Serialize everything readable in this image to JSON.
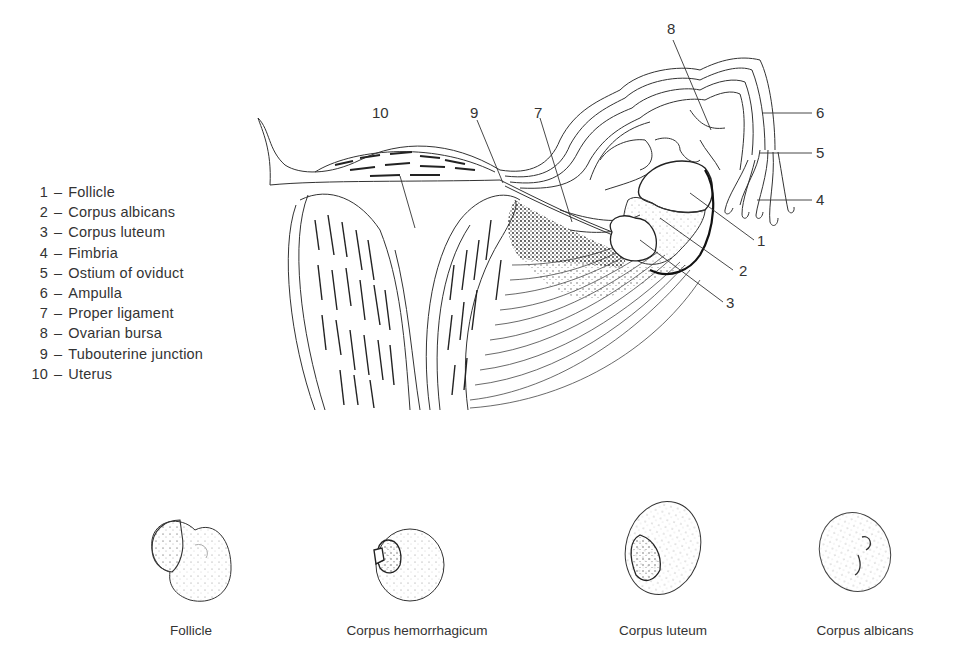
{
  "legend": {
    "items": [
      {
        "number": "1",
        "label": "Follicle"
      },
      {
        "number": "2",
        "label": "Corpus albicans"
      },
      {
        "number": "3",
        "label": "Corpus luteum"
      },
      {
        "number": "4",
        "label": "Fimbria"
      },
      {
        "number": "5",
        "label": "Ostium of oviduct"
      },
      {
        "number": "6",
        "label": "Ampulla"
      },
      {
        "number": "7",
        "label": "Proper ligament"
      },
      {
        "number": "8",
        "label": "Ovarian bursa"
      },
      {
        "number": "9",
        "label": "Tubouterine junction"
      },
      {
        "number": "10",
        "label": "Uterus"
      }
    ],
    "separator": "–"
  },
  "callouts": {
    "c1": "1",
    "c2": "2",
    "c3": "3",
    "c4": "4",
    "c5": "5",
    "c6": "6",
    "c7": "7",
    "c8": "8",
    "c9": "9",
    "c10": "10"
  },
  "stages": [
    {
      "label": "Follicle"
    },
    {
      "label": "Corpus hemorrhagicum"
    },
    {
      "label": "Corpus luteum"
    },
    {
      "label": "Corpus albicans"
    }
  ]
}
